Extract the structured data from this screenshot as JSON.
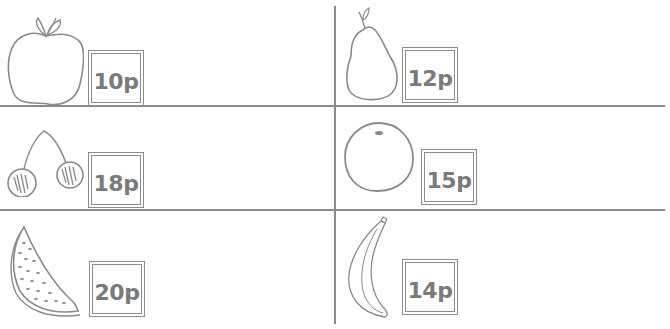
{
  "worksheet": {
    "line_color": "#8a8a8a",
    "items": [
      {
        "fruit": "apple",
        "price": "10p"
      },
      {
        "fruit": "pear",
        "price": "12p"
      },
      {
        "fruit": "cherries",
        "price": "18p"
      },
      {
        "fruit": "orange",
        "price": "15p"
      },
      {
        "fruit": "watermelon",
        "price": "20p"
      },
      {
        "fruit": "banana",
        "price": "14p"
      }
    ]
  }
}
